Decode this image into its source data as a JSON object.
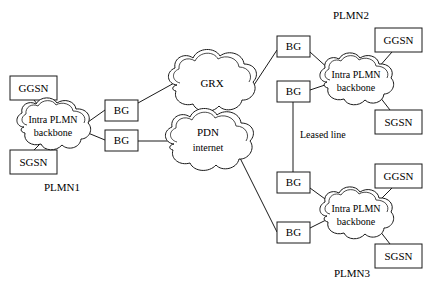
{
  "diagram": {
    "colors": {
      "stroke": "#1a1a1a",
      "fill": "#ffffff",
      "text": "#000000"
    },
    "networks": [
      {
        "id": "plmn1",
        "title": "PLMN1",
        "backbone_line1": "Intra PLMN",
        "backbone_line2": "backbone",
        "ggsn": "GGSN",
        "sgsn": "SGSN",
        "bg_upper": "BG",
        "bg_lower": "BG"
      },
      {
        "id": "plmn2",
        "title": "PLMN2",
        "backbone_line1": "Intra PLMN",
        "backbone_line2": "backbone",
        "ggsn": "GGSN",
        "sgsn": "SGSN",
        "bg_upper": "BG",
        "bg_lower": "BG"
      },
      {
        "id": "plmn3",
        "title": "PLMN3",
        "backbone_line1": "Intra PLMN",
        "backbone_line2": "backbone",
        "ggsn": "GGSN",
        "sgsn": "SGSN",
        "bg_upper": "BG",
        "bg_lower": "BG"
      }
    ],
    "transit_clouds": [
      {
        "id": "grx",
        "label": "GRX"
      },
      {
        "id": "pdn",
        "label_line1": "PDN",
        "label_line2": "internet"
      }
    ],
    "link_labels": {
      "leased_line": "Leased line"
    }
  }
}
